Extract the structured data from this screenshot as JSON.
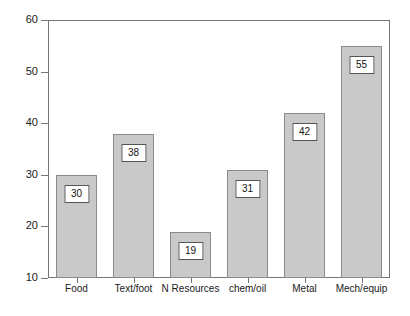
{
  "chart_data": {
    "type": "bar",
    "title": "",
    "subtitle": "",
    "xlabel": "",
    "ylabel": "",
    "categories": [
      "Food",
      "Text/foot",
      "N Resources",
      "chem/oil",
      "Metal",
      "Mech/equip"
    ],
    "values": [
      30,
      38,
      19,
      31,
      42,
      55
    ],
    "value_labels": [
      "30",
      "38",
      "19",
      "31",
      "42",
      "55"
    ],
    "ylim": [
      10,
      60
    ],
    "yticks": [
      10,
      20,
      30,
      40,
      50,
      60
    ],
    "ytick_labels": [
      "10",
      "20",
      "30",
      "40",
      "50",
      "60"
    ],
    "grid": false,
    "legend": false,
    "legend_position": "none",
    "annotations": [],
    "colors": {
      "bar_fill": "#c9c9c9",
      "bar_border": "#8a8a8a",
      "axis": "#767676",
      "text": "#1a1a1a",
      "label_box_fill": "#ffffff",
      "label_box_border": "#555555",
      "background": "#ffffff"
    }
  }
}
